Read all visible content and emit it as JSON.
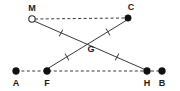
{
  "figure": {
    "type": "geometry-diagram",
    "width": 180,
    "height": 91,
    "background_color": "#ffffff",
    "stroke_color": "#3a3a3a",
    "label_color": "#1a1a1a",
    "dot_fill_color": "#111111",
    "hollow_fill_color": "#ffffff"
  },
  "points": [
    {
      "id": "M",
      "label": "M",
      "x": 32,
      "y": 19,
      "marker": "hollow-circle",
      "radius": 3.2,
      "label_x": 32,
      "label_y": 11
    },
    {
      "id": "C",
      "label": "C",
      "x": 128,
      "y": 18,
      "marker": "filled-circle",
      "radius": 3.2,
      "label_x": 131,
      "label_y": 10
    },
    {
      "id": "G",
      "label": "G",
      "x": 88,
      "y": 42,
      "marker": "none",
      "radius": 0,
      "label_x": 91,
      "label_y": 52
    },
    {
      "id": "A",
      "label": "A",
      "x": 16,
      "y": 71,
      "marker": "filled-circle",
      "radius": 3.4,
      "label_x": 16,
      "label_y": 86
    },
    {
      "id": "F",
      "label": "F",
      "x": 47,
      "y": 71,
      "marker": "filled-circle",
      "radius": 3.4,
      "label_x": 47,
      "label_y": 86
    },
    {
      "id": "H",
      "label": "H",
      "x": 147,
      "y": 71,
      "marker": "filled-circle",
      "radius": 3.4,
      "label_x": 147,
      "label_y": 86
    },
    {
      "id": "B",
      "label": "B",
      "x": 162,
      "y": 71,
      "marker": "filled-circle",
      "radius": 3.4,
      "label_x": 162,
      "label_y": 86
    }
  ],
  "segments": [
    {
      "id": "MC",
      "from": "M",
      "to": "C",
      "style": "dashed",
      "x1": 35,
      "y1": 19,
      "x2": 125,
      "y2": 18
    },
    {
      "id": "AB",
      "from": "A",
      "to": "B",
      "style": "dashed",
      "x1": 16,
      "y1": 71,
      "x2": 162,
      "y2": 71
    },
    {
      "id": "MH",
      "from": "M",
      "to": "H",
      "style": "solid",
      "x1": 34,
      "y1": 21,
      "x2": 146,
      "y2": 70
    },
    {
      "id": "FC",
      "from": "F",
      "to": "C",
      "style": "solid",
      "x1": 47,
      "y1": 69,
      "x2": 127,
      "y2": 20
    }
  ],
  "tick_marks": [
    {
      "id": "tick-MG",
      "on_segment": "MH",
      "x": 61,
      "y": 33,
      "angle": 28,
      "length": 7
    },
    {
      "id": "tick-GH",
      "on_segment": "MH",
      "x": 117,
      "y": 57,
      "angle": 28,
      "length": 7
    },
    {
      "id": "tick-FG",
      "on_segment": "FC",
      "x": 67,
      "y": 57,
      "angle": -31,
      "length": 7
    },
    {
      "id": "tick-GC",
      "on_segment": "FC",
      "x": 108,
      "y": 32,
      "angle": -31,
      "length": 7
    }
  ]
}
